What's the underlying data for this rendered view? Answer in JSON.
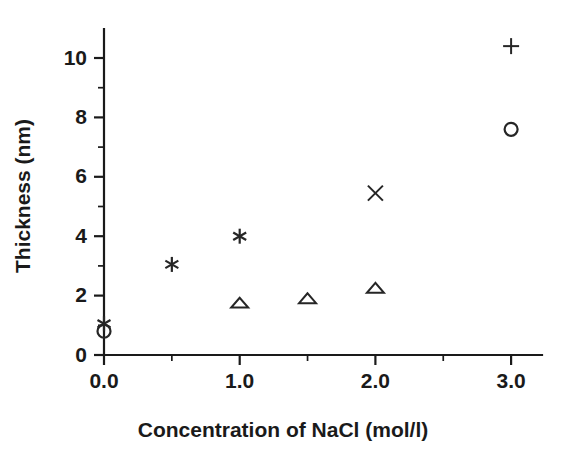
{
  "chart_data": {
    "type": "scatter",
    "title": "",
    "xlabel": "Concentration of NaCl (mol/l)",
    "ylabel": "Thickness (nm)",
    "xlim": [
      0.0,
      3.22
    ],
    "ylim": [
      0.0,
      10.9
    ],
    "grid": false,
    "legend": "none",
    "x_ticks_major": [
      "0.0",
      "1.0",
      "2.0",
      "3.0"
    ],
    "x_tick_values_major": [
      0.0,
      1.0,
      2.0,
      3.0
    ],
    "x_tick_values_minor": [
      0.5,
      1.5,
      2.5,
      3.0
    ],
    "y_ticks_major": [
      "0",
      "2",
      "4",
      "6",
      "8",
      "10"
    ],
    "y_tick_values_major": [
      0,
      2,
      4,
      6,
      8,
      10
    ],
    "y_tick_values_minor": [
      1,
      3,
      5,
      7,
      9
    ],
    "series": [
      {
        "name": "star-series",
        "marker": "star",
        "points": [
          {
            "x": 0.0,
            "y": 1.05
          },
          {
            "x": 0.5,
            "y": 3.05
          },
          {
            "x": 1.0,
            "y": 4.0
          }
        ]
      },
      {
        "name": "circle-series",
        "marker": "circle",
        "points": [
          {
            "x": 0.0,
            "y": 0.8
          },
          {
            "x": 3.0,
            "y": 7.6
          }
        ]
      },
      {
        "name": "triangle-series",
        "marker": "triangle",
        "points": [
          {
            "x": 1.0,
            "y": 1.75
          },
          {
            "x": 1.5,
            "y": 1.9
          },
          {
            "x": 2.0,
            "y": 2.25
          }
        ]
      },
      {
        "name": "cross-series",
        "marker": "cross",
        "points": [
          {
            "x": 2.0,
            "y": 5.45
          }
        ]
      },
      {
        "name": "plus-series",
        "marker": "plus",
        "points": [
          {
            "x": 3.0,
            "y": 10.4
          }
        ]
      }
    ],
    "colors": {
      "axis": "#1a1a1a",
      "marker": "#262626",
      "background": "#ffffff"
    }
  }
}
